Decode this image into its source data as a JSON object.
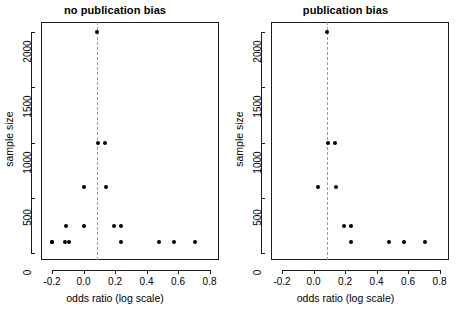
{
  "figure": {
    "width": 461,
    "height": 313,
    "background": "#ffffff",
    "point_color": "#000000",
    "axis_color": "#1a1a1a",
    "reference_line_color": "#9a9a9a"
  },
  "panels": [
    {
      "key": "no_bias",
      "title": "no publication bias",
      "xlabel": "odds ratio (log scale)",
      "ylabel": "sample size"
    },
    {
      "key": "bias",
      "title": "publication bias",
      "xlabel": "odds ratio (log scale)",
      "ylabel": "sample size"
    }
  ],
  "chart_data": [
    {
      "type": "scatter",
      "title": "no publication bias",
      "xlabel": "odds ratio (log scale)",
      "ylabel": "sample size",
      "xlim": [
        -0.27,
        0.86
      ],
      "ylim": [
        -60,
        2090
      ],
      "xticks": [
        -0.2,
        0.0,
        0.2,
        0.4,
        0.6,
        0.8
      ],
      "xtick_labels": [
        "-0.2",
        "0.0",
        "0.2",
        "0.4",
        "0.6",
        "0.8"
      ],
      "yticks": [
        0,
        500,
        1000,
        1500,
        2000
      ],
      "ytick_labels": [
        "0",
        "500",
        "1000",
        "1500",
        "2000"
      ],
      "grid": false,
      "legend": "none",
      "reference_line": {
        "orientation": "vertical",
        "x": 0.085,
        "style": "dashed"
      },
      "x": [
        0.085,
        0.095,
        0.135,
        0.0,
        0.145,
        -0.11,
        0.0,
        0.195,
        0.235,
        -0.2,
        -0.115,
        -0.09,
        0.235,
        0.48,
        0.575,
        0.71,
        -0.2
      ],
      "y": [
        2000,
        1000,
        1000,
        600,
        600,
        250,
        250,
        250,
        250,
        100,
        100,
        100,
        100,
        100,
        100,
        100,
        100
      ],
      "n_points": 17
    },
    {
      "type": "scatter",
      "title": "publication bias",
      "xlabel": "odds ratio (log scale)",
      "ylabel": "sample size",
      "xlim": [
        -0.27,
        0.86
      ],
      "ylim": [
        -60,
        2090
      ],
      "xticks": [
        -0.2,
        0.0,
        0.2,
        0.4,
        0.6,
        0.8
      ],
      "xtick_labels": [
        "-0.2",
        "0.0",
        "0.2",
        "0.4",
        "0.6",
        "0.8"
      ],
      "yticks": [
        0,
        500,
        1000,
        1500,
        2000
      ],
      "ytick_labels": [
        "0",
        "500",
        "1000",
        "1500",
        "2000"
      ],
      "grid": false,
      "legend": "none",
      "reference_line": {
        "orientation": "vertical",
        "x": 0.085,
        "style": "dashed"
      },
      "x": [
        0.085,
        0.095,
        0.135,
        0.03,
        0.145,
        0.195,
        0.235,
        0.235,
        0.48,
        0.575,
        0.71
      ],
      "y": [
        2000,
        1000,
        1000,
        600,
        600,
        250,
        250,
        100,
        100,
        100,
        100
      ],
      "n_points": 11
    }
  ]
}
